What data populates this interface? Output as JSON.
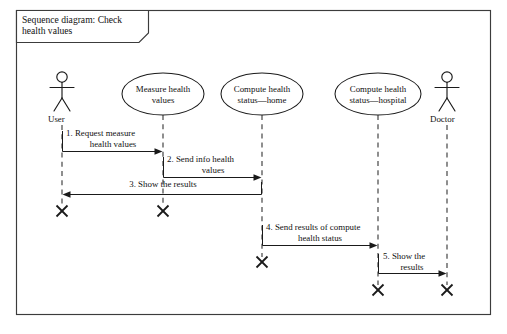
{
  "diagram": {
    "frame_title": "Sequence diagram: Check health values",
    "title_line_1": "Sequence diagram: Check",
    "title_line_2": "health values",
    "kind": "uml-sequence-diagram"
  },
  "lifelines": [
    {
      "id": "user",
      "type": "actor",
      "label": "User",
      "x": 62
    },
    {
      "id": "measure-health-values",
      "type": "use-case",
      "label": "Measure health values",
      "line_1": "Measure health",
      "line_2": "values",
      "x": 163
    },
    {
      "id": "compute-health-status-home",
      "type": "use-case",
      "label": "Compute health status—home",
      "line_1": "Compute health",
      "line_2": "status—home",
      "x": 262
    },
    {
      "id": "compute-health-status-hospital",
      "type": "use-case",
      "label": "Compute health status—hospital",
      "line_1": "Compute health",
      "line_2": "status—hospital",
      "x": 378
    },
    {
      "id": "doctor",
      "type": "actor",
      "label": "Doctor",
      "x": 447
    }
  ],
  "messages": [
    {
      "number": "1.",
      "text": "1. Request measure health values",
      "line_1": "1. Request measure",
      "line_2": "health values",
      "from": "user",
      "to": "measure-health-values",
      "direction": "right"
    },
    {
      "number": "2.",
      "text": "2. Send info health values",
      "line_1": "2. Send info health",
      "line_2": "values",
      "from": "measure-health-values",
      "to": "compute-health-status-home",
      "direction": "right"
    },
    {
      "number": "3.",
      "text": "3. Show the results",
      "line_1": "3. Show the results",
      "line_2": "",
      "from": "compute-health-status-home",
      "to": "user",
      "direction": "left"
    },
    {
      "number": "4.",
      "text": "4. Send results of compute health status",
      "line_1": "4. Send results of compute",
      "line_2": "health status",
      "from": "compute-health-status-home",
      "to": "compute-health-status-hospital",
      "direction": "right"
    },
    {
      "number": "5.",
      "text": "5. Show the results",
      "line_1": "5. Show the",
      "line_2": "results",
      "from": "compute-health-status-hospital",
      "to": "doctor",
      "direction": "right"
    }
  ],
  "terminators": [
    {
      "for": "user",
      "x": 62,
      "y": 211
    },
    {
      "for": "measure-health-values",
      "x": 163,
      "y": 211
    },
    {
      "for": "compute-health-status-home",
      "x": 262,
      "y": 262
    },
    {
      "for": "compute-health-status-hospital",
      "x": 378,
      "y": 290
    },
    {
      "for": "doctor",
      "x": 447,
      "y": 290
    }
  ],
  "colors": {
    "background": "#ffffff",
    "frame_stroke": "#3c3c3c",
    "ink": "#1a1a1a",
    "lifeline_stroke": "#2a2a2a"
  }
}
